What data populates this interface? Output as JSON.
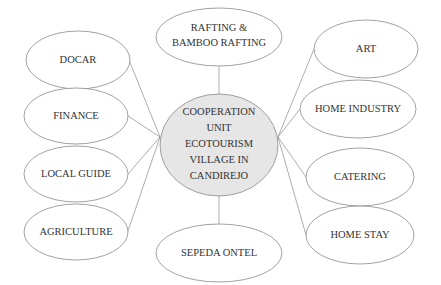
{
  "diagram": {
    "center": {
      "lines": [
        "COOPERATION",
        "UNIT",
        "ECOTOURISM",
        "VILLAGE IN",
        "CANDIREJO"
      ],
      "fill": "#e6e6e6"
    },
    "top": {
      "lines": [
        "RAFTING &",
        "BAMBOO RAFTING"
      ]
    },
    "bottom": {
      "label": "SEPEDA ONTEL"
    },
    "left": [
      {
        "label": "DOCAR"
      },
      {
        "label": "FINANCE"
      },
      {
        "label": "LOCAL GUIDE"
      },
      {
        "label": "AGRICULTURE"
      }
    ],
    "right": [
      {
        "label": "ART"
      },
      {
        "label": "HOME INDUSTRY"
      },
      {
        "label": "CATERING"
      },
      {
        "label": "HOME STAY"
      }
    ],
    "colors": {
      "stroke": "#8a8a8a",
      "text": "#333333",
      "background": "#ffffff"
    }
  }
}
